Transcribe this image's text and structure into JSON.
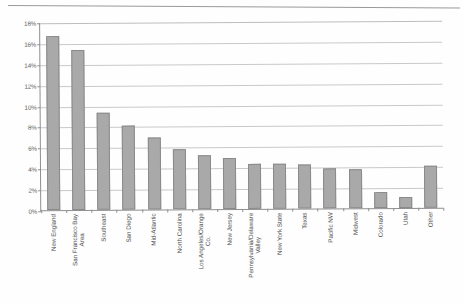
{
  "chart_data": {
    "type": "bar",
    "title": "",
    "subtitle": "",
    "xlabel": "",
    "ylabel": "",
    "ylim": [
      0,
      18
    ],
    "ytick_labels": [
      "18%",
      "16%",
      "14%",
      "12%",
      "10%",
      "8%",
      "6%",
      "4%",
      "2%",
      "0%"
    ],
    "ytick_values": [
      18,
      16,
      14,
      12,
      10,
      8,
      6,
      4,
      2,
      0
    ],
    "grid": true,
    "legend": false,
    "value_suffix": "%",
    "categories": [
      "New England",
      "San Francisco Bay Area",
      "Southeast",
      "San Diego",
      "Mid-Atlantic",
      "North Carolina",
      "Los Angeles/Orange Co.",
      "New Jersey",
      "Pennsylvania/Delaware Valley",
      "New York State",
      "Texas",
      "Pacific NW",
      "Midwest",
      "Colorado",
      "Utah",
      "Other"
    ],
    "category_lines": [
      [
        "New England"
      ],
      [
        "San Francisco Bay",
        "Area"
      ],
      [
        "Southeast"
      ],
      [
        "San Diego"
      ],
      [
        "Mid-Atlantic"
      ],
      [
        "North Carolina"
      ],
      [
        "Los Angeles/Orange",
        "Co."
      ],
      [
        "New Jersey"
      ],
      [
        "Pennsylvania/Delaware",
        "Valley"
      ],
      [
        "New York State"
      ],
      [
        "Texas"
      ],
      [
        "Pacific NW"
      ],
      [
        "Midwest"
      ],
      [
        "Colorado"
      ],
      [
        "Utah"
      ],
      [
        "Other"
      ]
    ],
    "values": [
      16.7,
      15.3,
      9.3,
      8.0,
      6.9,
      5.7,
      5.2,
      4.9,
      4.3,
      4.3,
      4.2,
      3.8,
      3.7,
      1.5,
      1.1,
      4.0
    ],
    "bar_color": "#a9a9a9",
    "bar_border_color": "#8a8a8a",
    "grid_color": "#c9c9c9",
    "axis_color": "#8f8f8f",
    "text_color": "#4a4a4a"
  }
}
